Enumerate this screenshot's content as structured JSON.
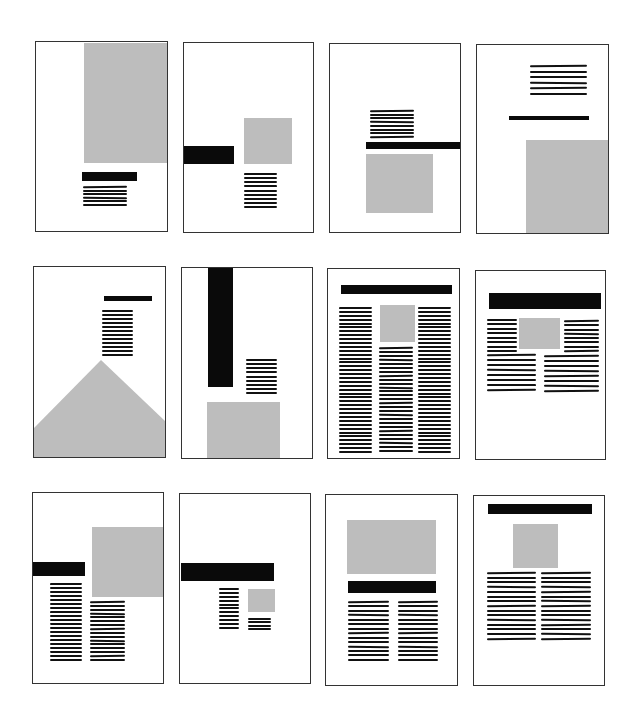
{
  "colors": {
    "image": "#bdbdbd",
    "headline": "#0a0a0a",
    "text": "#111111",
    "frame": "#333333"
  },
  "pages": [
    {
      "id": "p1",
      "frame": [
        35,
        41,
        133,
        191
      ],
      "elements": [
        {
          "type": "image",
          "box": [
            48,
            1,
            85,
            120
          ]
        },
        {
          "type": "headline",
          "box": [
            46,
            130,
            55,
            9
          ]
        },
        {
          "type": "text",
          "box": [
            47,
            144,
            44,
            20
          ],
          "lines": 6
        }
      ]
    },
    {
      "id": "p2",
      "frame": [
        183,
        42,
        131,
        191
      ],
      "elements": [
        {
          "type": "headline",
          "box": [
            0,
            103,
            50,
            18
          ]
        },
        {
          "type": "image",
          "box": [
            60,
            75,
            48,
            46
          ]
        },
        {
          "type": "text",
          "box": [
            60,
            130,
            33,
            35
          ],
          "lines": 9
        }
      ]
    },
    {
      "id": "p3",
      "frame": [
        329,
        43,
        132,
        190
      ],
      "elements": [
        {
          "type": "text",
          "box": [
            40,
            66,
            44,
            28
          ],
          "lines": 8
        },
        {
          "type": "headline",
          "box": [
            36,
            98,
            96,
            7
          ]
        },
        {
          "type": "image",
          "box": [
            36,
            110,
            67,
            59
          ]
        }
      ]
    },
    {
      "id": "p4",
      "frame": [
        476,
        44,
        133,
        190
      ],
      "elements": [
        {
          "type": "text",
          "box": [
            53,
            20,
            57,
            30
          ],
          "lines": 6
        },
        {
          "type": "headline",
          "box": [
            32,
            71,
            80,
            4
          ]
        },
        {
          "type": "image",
          "box": [
            49,
            95,
            84,
            95
          ]
        }
      ]
    },
    {
      "id": "p5",
      "frame": [
        33,
        266,
        133,
        192
      ],
      "elements": [
        {
          "type": "headline",
          "box": [
            70,
            29,
            48,
            5
          ]
        },
        {
          "type": "text",
          "box": [
            68,
            43,
            31,
            46
          ],
          "lines": 12
        },
        {
          "type": "triangle",
          "points": "0,161 67,93 133,156 133,192 0,192"
        }
      ]
    },
    {
      "id": "p6",
      "frame": [
        181,
        267,
        132,
        192
      ],
      "elements": [
        {
          "type": "headline",
          "box": [
            26,
            0,
            25,
            119
          ]
        },
        {
          "type": "text",
          "box": [
            64,
            91,
            31,
            35
          ],
          "lines": 9
        },
        {
          "type": "image",
          "box": [
            25,
            134,
            73,
            58
          ]
        }
      ]
    },
    {
      "id": "p7",
      "frame": [
        327,
        268,
        133,
        191
      ],
      "elements": [
        {
          "type": "headline",
          "box": [
            13,
            16,
            111,
            9
          ]
        },
        {
          "type": "text",
          "box": [
            11,
            38,
            33,
            146
          ],
          "lines": 38
        },
        {
          "type": "image",
          "box": [
            52,
            36,
            35,
            37
          ]
        },
        {
          "type": "text",
          "box": [
            51,
            78,
            34,
            105
          ],
          "lines": 27
        },
        {
          "type": "text",
          "box": [
            90,
            38,
            33,
            146
          ],
          "lines": 38
        }
      ]
    },
    {
      "id": "p8",
      "frame": [
        475,
        270,
        131,
        190
      ],
      "elements": [
        {
          "type": "headline",
          "box": [
            13,
            22,
            112,
            16
          ]
        },
        {
          "type": "text",
          "box": [
            11,
            48,
            30,
            33
          ],
          "lines": 8
        },
        {
          "type": "image",
          "box": [
            43,
            47,
            41,
            31
          ]
        },
        {
          "type": "text",
          "box": [
            88,
            49,
            35,
            32
          ],
          "lines": 8
        },
        {
          "type": "text",
          "box": [
            11,
            83,
            49,
            37
          ],
          "lines": 8
        },
        {
          "type": "text",
          "box": [
            68,
            84,
            55,
            37
          ],
          "lines": 8
        }
      ]
    },
    {
      "id": "p9",
      "frame": [
        32,
        492,
        132,
        192
      ],
      "elements": [
        {
          "type": "headline",
          "box": [
            0,
            69,
            52,
            14
          ]
        },
        {
          "type": "image",
          "box": [
            59,
            34,
            73,
            70
          ]
        },
        {
          "type": "text",
          "box": [
            17,
            90,
            32,
            78
          ],
          "lines": 20
        },
        {
          "type": "text",
          "box": [
            57,
            108,
            35,
            60
          ],
          "lines": 16
        }
      ]
    },
    {
      "id": "p10",
      "frame": [
        179,
        493,
        132,
        191
      ],
      "elements": [
        {
          "type": "headline",
          "box": [
            1,
            69,
            93,
            18
          ]
        },
        {
          "type": "text",
          "box": [
            39,
            94,
            20,
            41
          ],
          "lines": 11
        },
        {
          "type": "image",
          "box": [
            68,
            95,
            27,
            23
          ]
        },
        {
          "type": "text",
          "box": [
            68,
            124,
            23,
            12
          ],
          "lines": 4
        }
      ]
    },
    {
      "id": "p11",
      "frame": [
        325,
        494,
        133,
        192
      ],
      "elements": [
        {
          "type": "image",
          "box": [
            21,
            25,
            89,
            54
          ]
        },
        {
          "type": "headline",
          "box": [
            22,
            86,
            88,
            12
          ]
        },
        {
          "type": "text",
          "box": [
            22,
            106,
            41,
            60
          ],
          "lines": 14
        },
        {
          "type": "text",
          "box": [
            72,
            106,
            40,
            60
          ],
          "lines": 14
        }
      ]
    },
    {
      "id": "p12",
      "frame": [
        473,
        495,
        132,
        191
      ],
      "elements": [
        {
          "type": "headline",
          "box": [
            14,
            8,
            104,
            10
          ]
        },
        {
          "type": "image",
          "box": [
            39,
            28,
            45,
            44
          ]
        },
        {
          "type": "text",
          "box": [
            13,
            76,
            49,
            68
          ],
          "lines": 15
        },
        {
          "type": "text",
          "box": [
            67,
            76,
            50,
            68
          ],
          "lines": 15
        }
      ]
    }
  ]
}
